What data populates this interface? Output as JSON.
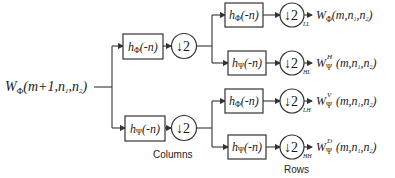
{
  "input": {
    "base": "W",
    "sub": "Φ",
    "args": "(m+1,n",
    "args_sub1": "1",
    "args_mid": ",n",
    "args_sub2": "2",
    "args_end": ")"
  },
  "stage1": {
    "label": "Columns",
    "filters": [
      {
        "base": "h",
        "sub": "Φ",
        "arg": "(-n)"
      },
      {
        "base": "h",
        "sub": "Ψ",
        "arg": "(-n)"
      }
    ],
    "downsample": "↓2"
  },
  "stage2": {
    "label": "Rows",
    "filters": [
      {
        "base": "h",
        "sub": "Φ",
        "arg": "(-n)"
      },
      {
        "base": "h",
        "sub": "Ψ",
        "arg": "(-n)"
      },
      {
        "base": "h",
        "sub": "Φ",
        "arg": "(-n)"
      },
      {
        "base": "h",
        "sub": "Ψ",
        "arg": "(-n)"
      }
    ],
    "downsample": "↓2"
  },
  "outputs": [
    {
      "band": "LL",
      "base": "W",
      "sub": "Φ",
      "sup": "",
      "args": "(m,n",
      "s1": "1",
      "mid": ",n",
      "s2": "2",
      "end": ")"
    },
    {
      "band": "HL",
      "base": "W",
      "sub": "Ψ",
      "sup": "H",
      "args": "(m,n",
      "s1": "1",
      "mid": ",n",
      "s2": "2",
      "end": ")"
    },
    {
      "band": "LH",
      "base": "W",
      "sub": "Ψ",
      "sup": "V",
      "args": "(m,n",
      "s1": "1",
      "mid": ",n",
      "s2": "2",
      "end": ")"
    },
    {
      "band": "HH",
      "base": "W",
      "sub": "Ψ",
      "sup": "D",
      "args": "(m,n",
      "s1": "1",
      "mid": ",n",
      "s2": "2",
      "end": ")"
    }
  ]
}
